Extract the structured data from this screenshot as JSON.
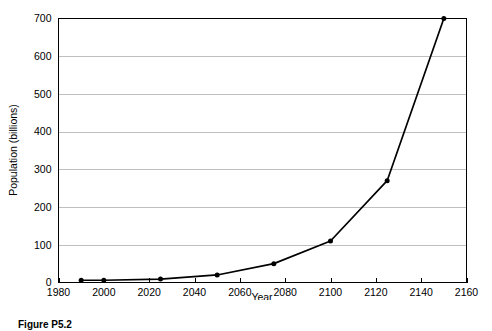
{
  "figure": {
    "caption": "Figure P5.2"
  },
  "chart_data": {
    "type": "line",
    "title": "",
    "subtitle": "",
    "xlabel": "Year",
    "ylabel": "Population (billions)",
    "xlim": [
      1980,
      2160
    ],
    "ylim": [
      0,
      700
    ],
    "xticks": [
      1980,
      2000,
      2020,
      2040,
      2060,
      2080,
      2100,
      2120,
      2140,
      2160
    ],
    "xtick_labels": [
      "1980",
      "2000",
      "2020",
      "2040",
      "2060",
      "2080",
      "2100",
      "2120",
      "2140",
      "2160"
    ],
    "yticks": [
      0,
      100,
      200,
      300,
      400,
      500,
      600,
      700
    ],
    "ytick_labels": [
      "0",
      "100",
      "200",
      "300",
      "400",
      "500",
      "600",
      "700"
    ],
    "grid": "horizontal",
    "legend": "none",
    "marker": "filled-circle",
    "line_color": "#000000",
    "grid_color": "#b8b8b8",
    "axis_color": "#000000",
    "x": [
      1990,
      2000,
      2025,
      2050,
      2075,
      2100,
      2125,
      2150
    ],
    "values": [
      6,
      6,
      9,
      20,
      50,
      110,
      270,
      700
    ],
    "series": [
      {
        "name": "Population",
        "x": [
          1990,
          2000,
          2025,
          2050,
          2075,
          2100,
          2125,
          2150
        ],
        "values": [
          6,
          6,
          9,
          20,
          50,
          110,
          270,
          700
        ]
      }
    ]
  }
}
